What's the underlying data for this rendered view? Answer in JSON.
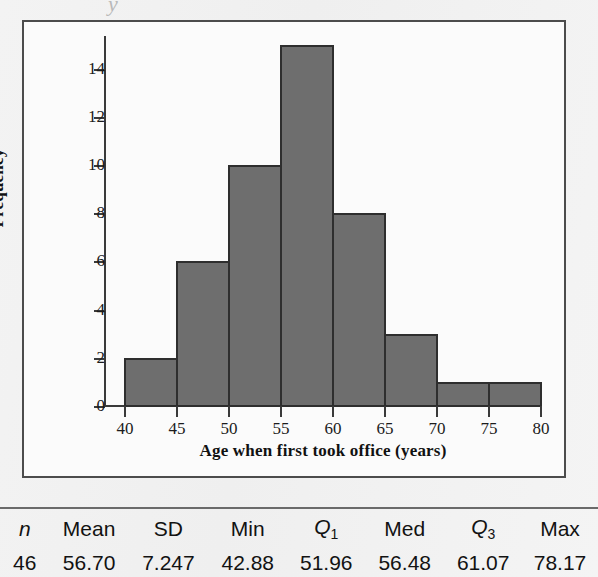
{
  "page": {
    "ghost_glyph": "y",
    "background_color": "#f1f1f1"
  },
  "chart_data": {
    "type": "bar",
    "subtype": "histogram",
    "title": "",
    "xlabel": "Age when first took office (years)",
    "ylabel": "Frequency",
    "xlim": [
      40,
      80
    ],
    "ylim": [
      0,
      15
    ],
    "xticks": [
      40,
      45,
      50,
      55,
      60,
      65,
      70,
      75,
      80
    ],
    "yticks": [
      0,
      2,
      4,
      6,
      8,
      10,
      12,
      14
    ],
    "grid": false,
    "legend": null,
    "bin_width": 5,
    "bin_edges": [
      40,
      45,
      50,
      55,
      60,
      65,
      70,
      75,
      80
    ],
    "categories": [
      "40-45",
      "45-50",
      "50-55",
      "55-60",
      "60-65",
      "65-70",
      "70-75",
      "75-80"
    ],
    "values": [
      2,
      6,
      10,
      15,
      8,
      3,
      1,
      1
    ],
    "bar_color": "#6e6e6e",
    "bar_edge_color": "#2e2e2e",
    "total_count": 46
  },
  "stats_table": {
    "headers": [
      "n",
      "Mean",
      "SD",
      "Min",
      "Q1",
      "Med",
      "Q3",
      "Max"
    ],
    "header_display": {
      "n": "n",
      "mean": "Mean",
      "sd": "SD",
      "min": "Min",
      "q1_base": "Q",
      "q1_sub": "1",
      "med": "Med",
      "q3_base": "Q",
      "q3_sub": "3",
      "max": "Max"
    },
    "values": {
      "n": "46",
      "mean": "56.70",
      "sd": "7.247",
      "min": "42.88",
      "q1": "51.96",
      "med": "56.48",
      "q3": "61.07",
      "max": "78.17"
    }
  }
}
